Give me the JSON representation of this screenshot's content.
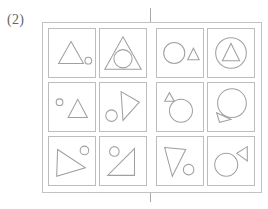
{
  "figure": {
    "label": "(2)",
    "caption_position": "top-left",
    "stroke_color": "#a0a0a0",
    "frame_color": "#c3c3c3",
    "cell_border_color": "#bdbdbd",
    "divider_color": "#a8a8a8",
    "background_color": "#ffffff"
  },
  "panel": {
    "frame": {
      "x": 42,
      "y": 22,
      "width": 220,
      "height": 171
    },
    "divider": {
      "x": 150,
      "y": 8,
      "height": 194,
      "orientation": "vertical"
    },
    "grid": {
      "rows": 3,
      "columns": 4
    }
  },
  "cells": [
    {
      "id": "cell-r1c1",
      "row": 1,
      "column": 1,
      "rect": {
        "x": 48,
        "y": 28,
        "width": 48,
        "height": 50
      },
      "shapes": [
        {
          "name": "triangle",
          "kind": "triangle",
          "points": "10,36 23,13 36,36",
          "size": "medium"
        },
        {
          "name": "circle",
          "kind": "circle",
          "cx": 41,
          "cy": 33,
          "r": 3.5,
          "size": "small"
        }
      ]
    },
    {
      "id": "cell-r1c2",
      "row": 1,
      "column": 2,
      "rect": {
        "x": 99,
        "y": 28,
        "width": 48,
        "height": 50
      },
      "shapes": [
        {
          "name": "triangle",
          "kind": "triangle",
          "points": "5,42 24,8 43,42",
          "size": "large"
        },
        {
          "name": "circle",
          "kind": "circle",
          "cx": 24,
          "cy": 31,
          "r": 9.5,
          "size": "medium"
        }
      ]
    },
    {
      "id": "cell-r1c3",
      "row": 1,
      "column": 3,
      "rect": {
        "x": 156,
        "y": 28,
        "width": 48,
        "height": 50
      },
      "shapes": [
        {
          "name": "circle",
          "kind": "circle",
          "cx": 18,
          "cy": 25,
          "r": 11,
          "size": "large"
        },
        {
          "name": "triangle",
          "kind": "triangle",
          "points": "32,32 38,20 44,32",
          "size": "small"
        }
      ]
    },
    {
      "id": "cell-r1c4",
      "row": 1,
      "column": 4,
      "rect": {
        "x": 207,
        "y": 28,
        "width": 48,
        "height": 50
      },
      "shapes": [
        {
          "name": "circle",
          "kind": "circle",
          "cx": 24,
          "cy": 25,
          "r": 16,
          "size": "large"
        },
        {
          "name": "triangle",
          "kind": "triangle",
          "points": "15,33 24,15 33,33",
          "size": "medium"
        }
      ]
    },
    {
      "id": "cell-r2c1",
      "row": 2,
      "column": 1,
      "rect": {
        "x": 48,
        "y": 82,
        "width": 48,
        "height": 50
      },
      "shapes": [
        {
          "name": "circle",
          "kind": "circle",
          "cx": 11,
          "cy": 20,
          "r": 3.5,
          "size": "small"
        },
        {
          "name": "triangle",
          "kind": "triangle",
          "points": "20,36 30,17 40,36",
          "size": "medium"
        }
      ]
    },
    {
      "id": "cell-r2c2",
      "row": 2,
      "column": 2,
      "rect": {
        "x": 99,
        "y": 82,
        "width": 48,
        "height": 50
      },
      "shapes": [
        {
          "name": "triangle-rotated",
          "kind": "triangle",
          "points": "22,9 41,20 24,39",
          "size": "large"
        },
        {
          "name": "circle",
          "kind": "circle",
          "cx": 12,
          "cy": 34,
          "r": 6,
          "size": "small"
        }
      ]
    },
    {
      "id": "cell-r2c3",
      "row": 2,
      "column": 3,
      "rect": {
        "x": 156,
        "y": 82,
        "width": 48,
        "height": 50
      },
      "shapes": [
        {
          "name": "triangle",
          "kind": "triangle",
          "points": "8,19 13,10 18,19",
          "size": "small"
        },
        {
          "name": "circle",
          "kind": "circle",
          "cx": 25,
          "cy": 29,
          "r": 12,
          "size": "large"
        }
      ]
    },
    {
      "id": "cell-r2c4",
      "row": 2,
      "column": 4,
      "rect": {
        "x": 207,
        "y": 82,
        "width": 48,
        "height": 50
      },
      "shapes": [
        {
          "name": "circle",
          "kind": "circle",
          "cx": 25,
          "cy": 21,
          "r": 15,
          "size": "large"
        },
        {
          "name": "triangle-rotated",
          "kind": "triangle",
          "points": "9,31 24,38 12,41",
          "size": "small"
        }
      ]
    },
    {
      "id": "cell-r3c1",
      "row": 3,
      "column": 1,
      "rect": {
        "x": 48,
        "y": 136,
        "width": 48,
        "height": 50
      },
      "shapes": [
        {
          "name": "triangle-rotated",
          "kind": "triangle",
          "points": "9,13 38,32 8,41",
          "size": "large"
        },
        {
          "name": "circle",
          "kind": "circle",
          "cx": 37,
          "cy": 14,
          "r": 4.5,
          "size": "small"
        }
      ]
    },
    {
      "id": "cell-r3c2",
      "row": 3,
      "column": 2,
      "rect": {
        "x": 99,
        "y": 136,
        "width": 48,
        "height": 50
      },
      "shapes": [
        {
          "name": "circle",
          "kind": "circle",
          "cx": 15,
          "cy": 15,
          "r": 5,
          "size": "small"
        },
        {
          "name": "right-triangle",
          "kind": "triangle",
          "points": "36,12 36,40 8,40",
          "size": "large"
        }
      ]
    },
    {
      "id": "cell-r3c3",
      "row": 3,
      "column": 3,
      "rect": {
        "x": 156,
        "y": 136,
        "width": 48,
        "height": 50
      },
      "shapes": [
        {
          "name": "triangle-rotated",
          "kind": "triangle",
          "points": "8,11 30,13 16,41",
          "size": "large"
        },
        {
          "name": "circle",
          "kind": "circle",
          "cx": 33,
          "cy": 34,
          "r": 5.5,
          "size": "small"
        }
      ]
    },
    {
      "id": "cell-r3c4",
      "row": 3,
      "column": 4,
      "rect": {
        "x": 207,
        "y": 136,
        "width": 48,
        "height": 50
      },
      "shapes": [
        {
          "name": "circle",
          "kind": "circle",
          "cx": 19,
          "cy": 29,
          "r": 12,
          "size": "large"
        },
        {
          "name": "triangle-rotated",
          "kind": "triangle",
          "points": "41,10 41,25 30,17",
          "size": "small"
        }
      ]
    }
  ]
}
